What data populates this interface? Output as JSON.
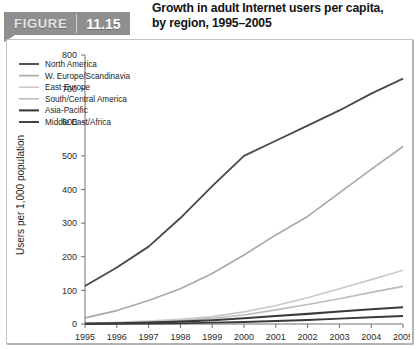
{
  "figure": {
    "label": "FIGURE",
    "number": "11.15",
    "title_line1": "Growth in adult Internet users per capita,",
    "title_line2": "by region, 1995–2005",
    "banner_color": "#8f8f8f"
  },
  "chart_data": {
    "type": "line",
    "title": "Growth in adult Internet users per capita, by region, 1995–2005",
    "xlabel": "",
    "ylabel": "Users per 1,000 population",
    "x": [
      1995,
      1996,
      1997,
      1998,
      1999,
      2000,
      2001,
      2002,
      2003,
      2004,
      2005
    ],
    "categories": [
      "1995",
      "1996",
      "1997",
      "1998",
      "1999",
      "2000",
      "2001",
      "2002",
      "2003",
      "2004",
      "2005"
    ],
    "xlim": [
      1995,
      2005
    ],
    "ylim": [
      0,
      800
    ],
    "yticks": [
      0,
      100,
      200,
      300,
      400,
      500,
      600,
      700,
      800
    ],
    "grid": false,
    "legend_position": "top-left",
    "series": [
      {
        "name": "North America",
        "color": "#4a4a4a",
        "width": 1.9,
        "values": [
          113,
          168,
          230,
          315,
          410,
          500,
          545,
          590,
          635,
          685,
          730
        ]
      },
      {
        "name": "W. Europe/Scandinavia",
        "color": "#a9a9a9",
        "width": 1.7,
        "values": [
          18,
          40,
          70,
          105,
          150,
          205,
          265,
          320,
          390,
          460,
          528
        ]
      },
      {
        "name": "East Europe",
        "color": "#c9c9c9",
        "width": 1.6,
        "values": [
          2,
          5,
          9,
          14,
          22,
          36,
          55,
          78,
          105,
          132,
          160
        ]
      },
      {
        "name": "South/Central America",
        "color": "#bcbcbc",
        "width": 1.6,
        "values": [
          1,
          3,
          6,
          10,
          17,
          27,
          42,
          58,
          75,
          94,
          112
        ]
      },
      {
        "name": "Asia-Pacific",
        "color": "#3a3a3a",
        "width": 2.1,
        "values": [
          1,
          2,
          4,
          7,
          11,
          17,
          24,
          30,
          37,
          44,
          50
        ]
      },
      {
        "name": "Middle East/Africa",
        "color": "#3a3a3a",
        "width": 1.9,
        "values": [
          0,
          1,
          1,
          2,
          4,
          6,
          9,
          12,
          16,
          20,
          24
        ]
      }
    ]
  }
}
